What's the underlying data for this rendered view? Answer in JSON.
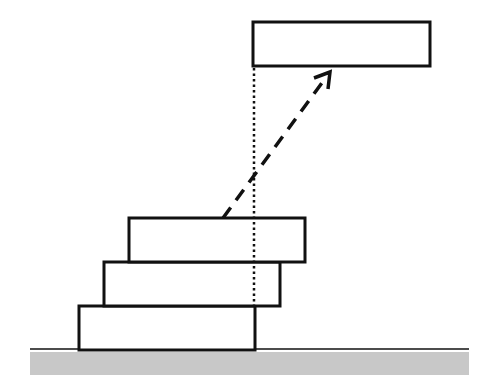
{
  "diagram": {
    "colors": {
      "stroke": "#111111",
      "ground_fill": "#c8c8c8",
      "background": "#ffffff"
    },
    "blocks": [
      {
        "id": "block-1",
        "x": 79,
        "y": 306,
        "w": 176,
        "h": 44
      },
      {
        "id": "block-2",
        "x": 104,
        "y": 262,
        "w": 176,
        "h": 44
      },
      {
        "id": "block-3",
        "x": 129,
        "y": 218,
        "w": 176,
        "h": 44
      },
      {
        "id": "block-moved",
        "x": 253,
        "y": 22,
        "w": 177,
        "h": 44
      }
    ],
    "ground": {
      "line_y": 349,
      "x1": 30,
      "x2": 469,
      "band_y": 352,
      "band_h": 23
    },
    "dotted_line": {
      "x": 254,
      "y1": 67,
      "y2": 306
    },
    "arrow": {
      "x1": 223,
      "y1": 218,
      "x2": 330,
      "y2": 72
    }
  }
}
